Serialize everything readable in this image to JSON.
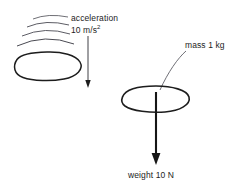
{
  "diagram": {
    "background_color": "#ffffff",
    "stroke_color": "#1d1d1d",
    "motion_line_color": "#4a4a52",
    "leader_line_color": "#55555d",
    "labels": {
      "acceleration": "acceleration",
      "acceleration_value_number": "10 m/s",
      "acceleration_value_exponent": "2",
      "mass": "mass 1 kg",
      "weight": "weight 10 N"
    },
    "left_object": {
      "name": "accelerating-blob",
      "center_x": 48,
      "center_y": 66,
      "radius_x": 34,
      "radius_y": 14
    },
    "right_object": {
      "name": "mass-blob",
      "center_x": 156,
      "center_y": 99,
      "radius_x": 34,
      "radius_y": 13
    },
    "motion_arcs": {
      "count": 4,
      "description": "curved speed lines above left object"
    },
    "acceleration_arrow": {
      "x": 88,
      "y_start": 36,
      "y_end": 87,
      "direction": "down",
      "weight": "thin"
    },
    "weight_arrow": {
      "x": 156,
      "y_start": 92,
      "y_end": 165,
      "direction": "down",
      "weight": "thick"
    },
    "leader_line": {
      "from_x": 184,
      "from_y": 52,
      "to_x": 160,
      "to_y": 90
    }
  }
}
